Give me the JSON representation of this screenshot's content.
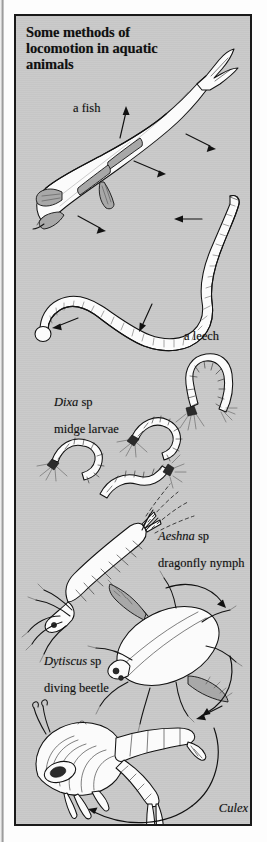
{
  "figure": {
    "title": "Some methods of\nlocomotion in aquatic\nanimals",
    "background_color": "#c9c9c9",
    "border_color": "#1a1a1a",
    "page_color": "#fdfdfd",
    "ink_color": "#131313"
  },
  "labels": {
    "fish": "a fish",
    "leech": "a leech",
    "dixa_genus": "Dixa",
    "dixa_sp": " sp",
    "dixa_common": "midge larvae",
    "aeshna_genus": "Aeshna",
    "aeshna_sp": " sp",
    "aeshna_common": "dragonfly nymph",
    "dytiscus_genus": "Dytiscus",
    "dytiscus_sp": " sp",
    "dytiscus_common": "diving beetle",
    "culex_genus": "Culex",
    "culex_common_1": "mosquito",
    "culex_common_2": "pupa"
  },
  "organisms": [
    {
      "name": "fish",
      "label": "a fish",
      "locomotion": "lateral body undulation",
      "motion_arrows": 4
    },
    {
      "name": "leech",
      "label": "a leech",
      "locomotion": "vertical body undulation",
      "motion_arrows": 3
    },
    {
      "name": "dixa-midge-larvae",
      "label": "Dixa sp midge larvae",
      "locomotion": "flicking U-shaped body",
      "specimens": 4
    },
    {
      "name": "aeshna-dragonfly-nymph",
      "label": "Aeshna sp dragonfly nymph",
      "locomotion": "jet propulsion",
      "jet_streams": 4
    },
    {
      "name": "dytiscus-diving-beetle",
      "label": "Dytiscus sp diving beetle",
      "locomotion": "rowing with hind legs",
      "motion_arrows": 2
    },
    {
      "name": "culex-mosquito-pupa",
      "label": "Culex mosquito pupa",
      "locomotion": "abdominal flexion tumbling",
      "motion_arrows": 2
    }
  ],
  "icons": {
    "arrow": "motion-arrow",
    "dashed_jet": "water-jet-dashes"
  }
}
